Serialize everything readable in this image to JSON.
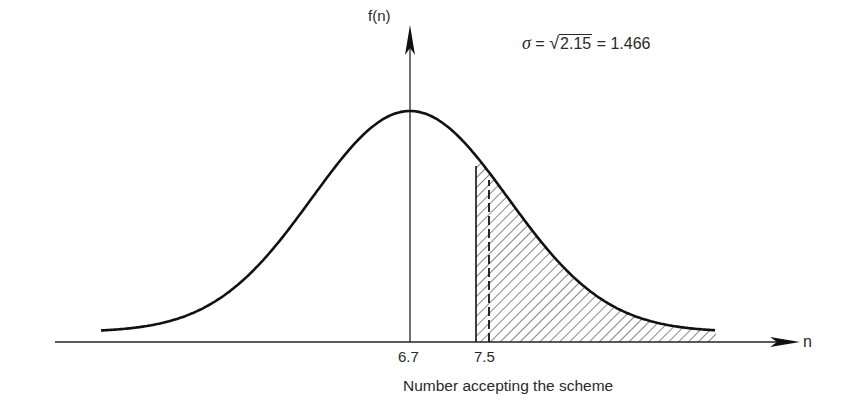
{
  "diagram": {
    "y_axis_label": "f(n)",
    "x_axis_label": "n",
    "x_axis_title": "Number accepting the scheme",
    "mean_tick_label": "6.7",
    "threshold_tick_label": "7.5",
    "formula": {
      "symbol": "σ",
      "eq1": "=",
      "radicand": "2.15",
      "eq2": "=",
      "result": "1.466"
    }
  },
  "chart_data": {
    "type": "area",
    "title": "",
    "distribution": "normal",
    "mean": 6.7,
    "variance": 2.15,
    "sigma": 1.466,
    "xlabel": "Number accepting the scheme",
    "ylabel": "f(n)",
    "x_ticks": [
      6.7,
      7.5
    ],
    "shaded_region": {
      "from": 7.5,
      "to": "right tail",
      "hatch": "diagonal"
    },
    "dashed_marker": "vertical dashed line inside shaded region near left edge",
    "grid": false,
    "legend": null,
    "annotation": "σ = √2.15 = 1.466"
  }
}
